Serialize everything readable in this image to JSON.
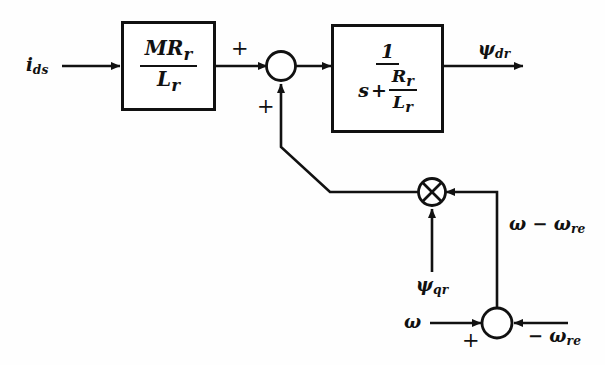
{
  "figure": {
    "type": "block-diagram",
    "background_color": "#fefefe",
    "line_color": "#111111"
  },
  "inputs": {
    "current": "i",
    "current_sub": "ds",
    "omega": "ω",
    "omega_neg_re": "− ω",
    "omega_neg_re_sub": "re",
    "psi_q": "ψ",
    "psi_q_sub": "qr"
  },
  "outputs": {
    "psi_d": "ψ",
    "psi_d_sub": "dr"
  },
  "blocks": [
    {
      "name": "gain-block",
      "numerator": "MR",
      "numerator_sub": "r",
      "denominator": "L",
      "denominator_sub": "r"
    },
    {
      "name": "lag-block",
      "numerator": "1",
      "denominator_lead": "s",
      "denominator_op": "+",
      "denominator_frac_num": "R",
      "denominator_frac_num_sub": "r",
      "denominator_frac_den": "L",
      "denominator_frac_den_sub": "r"
    }
  ],
  "junctions": {
    "top_sum": {
      "name": "top-summing-junction",
      "sign_in_left": "+",
      "sign_in_bottom": "+"
    },
    "multiplier": {
      "name": "multiplier-junction",
      "symbol": "×"
    },
    "bottom_sum": {
      "name": "bottom-summing-junction",
      "sign_in_left": "+"
    }
  },
  "signals": {
    "slip_speed": "ω − ω",
    "slip_speed_sub": "re"
  }
}
